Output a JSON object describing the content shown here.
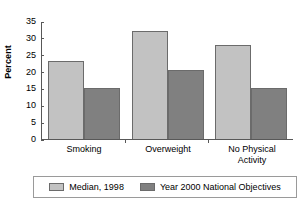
{
  "chart_data": {
    "type": "bar",
    "title": "",
    "subtitle": "",
    "xlabel": "",
    "ylabel": "Percent",
    "ylim": [
      0,
      35
    ],
    "yticks": [
      0,
      5,
      10,
      15,
      20,
      25,
      30,
      35
    ],
    "ytick_labels": [
      "0",
      "5",
      "10",
      "15",
      "20",
      "25",
      "30",
      "35"
    ],
    "grid": false,
    "legend_position": "bottom",
    "categories": [
      "Smoking",
      "Overweight",
      "No Physical\nActivity"
    ],
    "series": [
      {
        "name": "Median, 1998",
        "color": "#c2c2c2",
        "values": [
          23,
          32,
          28
        ]
      },
      {
        "name": "Year 2000 National Objectives",
        "color": "#808080",
        "values": [
          15,
          20.5,
          15
        ]
      }
    ]
  },
  "axes": {
    "y_title": "Percent"
  }
}
